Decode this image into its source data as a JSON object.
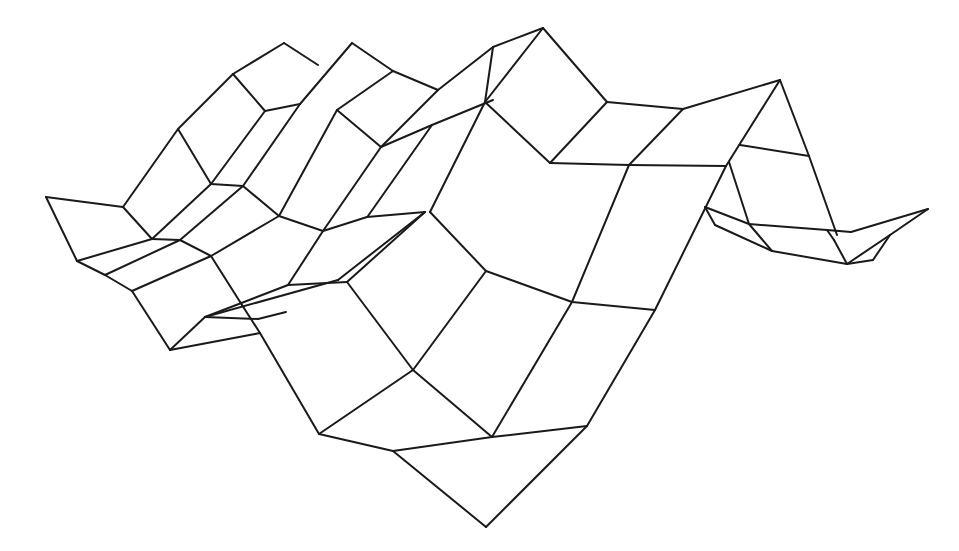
{
  "figure": {
    "width": 959,
    "height": 551,
    "background": "#ffffff",
    "stroke": "#1a1a1a",
    "stroke_width": 2
  },
  "segments": [
    [
      46,
      197,
      123,
      207
    ],
    [
      46,
      197,
      77,
      261
    ],
    [
      123,
      207,
      152,
      239
    ],
    [
      123,
      207,
      178,
      129
    ],
    [
      178,
      129,
      233,
      74
    ],
    [
      233,
      74,
      284,
      43
    ],
    [
      284,
      43,
      318,
      65
    ],
    [
      178,
      129,
      211,
      184
    ],
    [
      233,
      74,
      265,
      111
    ],
    [
      265,
      111,
      300,
      104
    ],
    [
      300,
      104,
      352,
      43
    ],
    [
      352,
      43,
      393,
      71
    ],
    [
      393,
      71,
      438,
      90
    ],
    [
      265,
      111,
      211,
      184
    ],
    [
      300,
      104,
      243,
      186
    ],
    [
      211,
      184,
      243,
      186
    ],
    [
      243,
      186,
      279,
      216
    ],
    [
      243,
      186,
      180,
      240
    ],
    [
      211,
      184,
      152,
      239
    ],
    [
      337,
      110,
      393,
      71
    ],
    [
      337,
      110,
      381,
      147
    ],
    [
      337,
      110,
      279,
      216
    ],
    [
      381,
      147,
      323,
      231
    ],
    [
      279,
      216,
      323,
      231
    ],
    [
      323,
      231,
      367,
      217
    ],
    [
      367,
      217,
      425,
      212
    ],
    [
      381,
      147,
      438,
      90
    ],
    [
      381,
      147,
      432,
      125
    ],
    [
      432,
      125,
      493,
      100
    ],
    [
      438,
      90,
      493,
      47
    ],
    [
      493,
      47,
      485,
      102
    ],
    [
      485,
      102,
      430,
      212
    ],
    [
      432,
      125,
      368,
      216
    ],
    [
      493,
      47,
      543,
      28
    ],
    [
      543,
      28,
      485,
      102
    ],
    [
      543,
      28,
      607,
      102
    ],
    [
      485,
      102,
      550,
      163
    ],
    [
      607,
      102,
      550,
      163
    ],
    [
      607,
      102,
      683,
      109
    ],
    [
      683,
      109,
      629,
      165
    ],
    [
      550,
      163,
      629,
      165
    ],
    [
      683,
      109,
      780,
      80
    ],
    [
      780,
      80,
      726,
      166
    ],
    [
      629,
      165,
      726,
      166
    ],
    [
      780,
      80,
      809,
      156
    ],
    [
      809,
      156,
      837,
      235
    ],
    [
      740,
      145,
      809,
      156
    ],
    [
      729,
      162,
      749,
      224
    ],
    [
      749,
      224,
      827,
      230
    ],
    [
      749,
      224,
      772,
      251
    ],
    [
      705,
      207,
      749,
      224
    ],
    [
      705,
      207,
      715,
      225
    ],
    [
      715,
      225,
      772,
      251
    ],
    [
      772,
      251,
      847,
      264
    ],
    [
      827,
      230,
      834,
      240
    ],
    [
      834,
      240,
      847,
      264
    ],
    [
      847,
      264,
      873,
      260
    ],
    [
      873,
      260,
      890,
      235
    ],
    [
      827,
      230,
      851,
      232
    ],
    [
      851,
      232,
      928,
      209
    ],
    [
      928,
      209,
      890,
      235
    ],
    [
      890,
      235,
      847,
      264
    ],
    [
      77,
      261,
      152,
      239
    ],
    [
      77,
      261,
      105,
      275
    ],
    [
      105,
      275,
      180,
      240
    ],
    [
      105,
      275,
      132,
      291
    ],
    [
      132,
      291,
      211,
      256
    ],
    [
      152,
      239,
      180,
      240
    ],
    [
      180,
      240,
      211,
      256
    ],
    [
      211,
      256,
      279,
      216
    ],
    [
      132,
      291,
      170,
      350
    ],
    [
      170,
      350,
      205,
      317
    ],
    [
      205,
      317,
      258,
      319
    ],
    [
      258,
      319,
      286,
      312
    ],
    [
      211,
      256,
      242,
      305
    ],
    [
      242,
      305,
      260,
      333
    ],
    [
      170,
      350,
      255,
      334
    ],
    [
      255,
      334,
      260,
      333
    ],
    [
      205,
      317,
      288,
      285
    ],
    [
      288,
      285,
      347,
      282
    ],
    [
      205,
      317,
      338,
      280
    ],
    [
      288,
      285,
      323,
      231
    ],
    [
      338,
      280,
      425,
      212
    ],
    [
      347,
      282,
      425,
      212
    ],
    [
      260,
      333,
      319,
      434
    ],
    [
      347,
      282,
      413,
      370
    ],
    [
      319,
      434,
      413,
      370
    ],
    [
      413,
      370,
      486,
      271
    ],
    [
      486,
      271,
      430,
      212
    ],
    [
      486,
      271,
      572,
      302
    ],
    [
      572,
      302,
      629,
      165
    ],
    [
      572,
      302,
      655,
      310
    ],
    [
      655,
      310,
      726,
      166
    ],
    [
      413,
      370,
      492,
      437
    ],
    [
      492,
      437,
      572,
      302
    ],
    [
      492,
      437,
      587,
      426
    ],
    [
      587,
      426,
      655,
      310
    ],
    [
      319,
      434,
      393,
      451
    ],
    [
      393,
      451,
      492,
      437
    ],
    [
      393,
      451,
      486,
      527
    ],
    [
      486,
      527,
      587,
      426
    ]
  ]
}
